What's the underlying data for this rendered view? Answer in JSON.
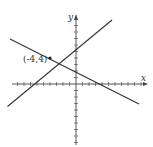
{
  "chart_data": {
    "type": "line",
    "title": "",
    "xlabel": "x",
    "ylabel": "y",
    "xlim": [
      -9,
      11
    ],
    "ylim": [
      -9,
      10
    ],
    "grid": false,
    "ticks": "unit ticks on both axes, unlabeled",
    "series": [
      {
        "name": "line-1",
        "equation": "y = x + 8",
        "points": [
          [
            -11.5,
            -3.5
          ],
          [
            5.5,
            13.5
          ]
        ]
      },
      {
        "name": "line-2",
        "equation": "y = -x/2 + 2",
        "points": [
          [
            -11.5,
            7.75
          ],
          [
            11.5,
            -3.75
          ]
        ]
      }
    ],
    "annotations": [
      {
        "text": "(-4,4)",
        "x": -4,
        "y": 4,
        "note": "intersection point"
      }
    ]
  },
  "labels": {
    "x_axis": "x",
    "y_axis": "y",
    "point": "(-4,4)"
  },
  "colors": {
    "line": "#333333",
    "axis": "#444444"
  }
}
